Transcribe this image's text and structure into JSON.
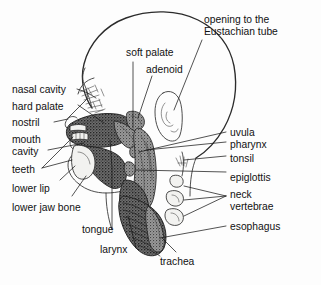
{
  "figure": {
    "background_color": "#fdfdfd",
    "ink_color": "#1a1a1a",
    "view": "left-facing lateral (sagittal) cross-section"
  },
  "labels": {
    "nasal_cavity": "nasal cavity",
    "hard_palate": "hard palate",
    "nostril": "nostril",
    "mouth_cavity_line1": "mouth",
    "mouth_cavity_line2": "cavity",
    "teeth": "teeth",
    "lower_lip": "lower lip",
    "lower_jaw_bone": "lower jaw bone",
    "tongue": "tongue",
    "larynx": "larynx",
    "trachea": "trachea",
    "soft_palate": "soft palate",
    "adenoid": "adenoid",
    "eustachian_line1": "opening to the",
    "eustachian_line2": "Eustachian tube",
    "uvula": "uvula",
    "pharynx": "pharynx",
    "tonsil": "tonsil",
    "epiglottis": "epiglottis",
    "neck_vertebrae_line1": "neck",
    "neck_vertebrae_line2": "vertebrae",
    "esophagus": "esophagus"
  },
  "structures": [
    {
      "name": "skull-head-outline",
      "kind": "outline"
    },
    {
      "name": "ear-pinna",
      "kind": "line-drawing"
    },
    {
      "name": "nasal-turbinates",
      "kind": "sketch"
    },
    {
      "name": "hard-palate-plate",
      "kind": "bone"
    },
    {
      "name": "soft-palate-tissue",
      "kind": "tissue"
    },
    {
      "name": "adenoid-mass",
      "kind": "tissue"
    },
    {
      "name": "tongue-body",
      "kind": "tissue-dark"
    },
    {
      "name": "pharynx-wall",
      "kind": "tissue"
    },
    {
      "name": "epiglottis-flap",
      "kind": "tissue"
    },
    {
      "name": "larynx-box",
      "kind": "tissue-dark"
    },
    {
      "name": "trachea-rings",
      "kind": "ringed-tube"
    },
    {
      "name": "esophagus-tube",
      "kind": "tissue"
    },
    {
      "name": "lower-jaw-bone",
      "kind": "bone"
    },
    {
      "name": "teeth-row",
      "kind": "bone"
    },
    {
      "name": "neck-vertebra-1",
      "kind": "bone"
    },
    {
      "name": "neck-vertebra-2",
      "kind": "bone"
    },
    {
      "name": "neck-vertebra-3",
      "kind": "bone"
    }
  ]
}
